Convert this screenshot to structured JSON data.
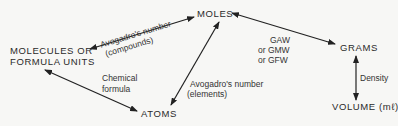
{
  "diagram": {
    "nodes": {
      "moles": "MOLES",
      "molecules_line1": "MOLECULES OR",
      "molecules_line2": "FORMULA UNITS",
      "grams": "GRAMS",
      "atoms": "ATOMS",
      "volume": "VOLUME (mℓ)"
    },
    "edges": {
      "molecules_moles": {
        "line1": "Avogadro's number",
        "line2": "(compounds)"
      },
      "moles_grams": {
        "line1": "GAW",
        "line2": "or GMW",
        "line3": "or GFW"
      },
      "atoms_moles": {
        "line1": "Avogadro's number",
        "line2": "(elements)"
      },
      "molecules_atoms": {
        "line1": "Chemical",
        "line2": "formula"
      },
      "grams_volume": {
        "line1": "Density"
      }
    },
    "colors": {
      "line": "#222222",
      "text": "#2a2a2a",
      "background": "#f7f7f5"
    }
  }
}
